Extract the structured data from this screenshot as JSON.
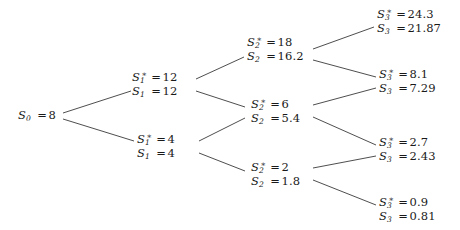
{
  "figure": {
    "type": "binomial-tree",
    "title": "",
    "background_color": "#ffffff",
    "text_color": "#1a1a1a",
    "edge_color": "#3a3a3a"
  },
  "nodes": {
    "s0": {
      "id": "s0",
      "step": 0,
      "lines": [
        {
          "symbol": "S",
          "sub": "0",
          "star": false,
          "eq": "=",
          "value": "8"
        }
      ]
    },
    "s1_up": {
      "id": "s1-up",
      "step": 1,
      "lines": [
        {
          "symbol": "S",
          "sub": "1",
          "star": true,
          "eq": "=",
          "value": "12"
        },
        {
          "symbol": "S",
          "sub": "1",
          "star": false,
          "eq": "=",
          "value": "12"
        }
      ]
    },
    "s1_down": {
      "id": "s1-down",
      "step": 1,
      "lines": [
        {
          "symbol": "S",
          "sub": "1",
          "star": true,
          "eq": "=",
          "value": "4"
        },
        {
          "symbol": "S",
          "sub": "1",
          "star": false,
          "eq": "=",
          "value": "4"
        }
      ]
    },
    "s2_uu": {
      "id": "s2-uu",
      "step": 2,
      "lines": [
        {
          "symbol": "S",
          "sub": "2",
          "star": true,
          "eq": "=",
          "value": "18"
        },
        {
          "symbol": "S",
          "sub": "2",
          "star": false,
          "eq": "=",
          "value": "16.2"
        }
      ]
    },
    "s2_ud": {
      "id": "s2-ud",
      "step": 2,
      "lines": [
        {
          "symbol": "S",
          "sub": "2",
          "star": true,
          "eq": "=",
          "value": "6"
        },
        {
          "symbol": "S",
          "sub": "2",
          "star": false,
          "eq": "=",
          "value": "5.4"
        }
      ]
    },
    "s2_dd": {
      "id": "s2-dd",
      "step": 2,
      "lines": [
        {
          "symbol": "S",
          "sub": "2",
          "star": true,
          "eq": "=",
          "value": "2"
        },
        {
          "symbol": "S",
          "sub": "2",
          "star": false,
          "eq": "=",
          "value": "1.8"
        }
      ]
    },
    "s3_uuu": {
      "id": "s3-uuu",
      "step": 3,
      "lines": [
        {
          "symbol": "S",
          "sub": "3",
          "star": true,
          "eq": "=",
          "value": "24.3"
        },
        {
          "symbol": "S",
          "sub": "3",
          "star": false,
          "eq": "=",
          "value": "21.87"
        }
      ]
    },
    "s3_uud": {
      "id": "s3-uud",
      "step": 3,
      "lines": [
        {
          "symbol": "S",
          "sub": "3",
          "star": true,
          "eq": "=",
          "value": "8.1"
        },
        {
          "symbol": "S",
          "sub": "3",
          "star": false,
          "eq": "=",
          "value": "7.29"
        }
      ]
    },
    "s3_udd": {
      "id": "s3-udd",
      "step": 3,
      "lines": [
        {
          "symbol": "S",
          "sub": "3",
          "star": true,
          "eq": "=",
          "value": "2.7"
        },
        {
          "symbol": "S",
          "sub": "3",
          "star": false,
          "eq": "=",
          "value": "2.43"
        }
      ]
    },
    "s3_ddd": {
      "id": "s3-ddd",
      "step": 3,
      "lines": [
        {
          "symbol": "S",
          "sub": "3",
          "star": true,
          "eq": "=",
          "value": "0.9"
        },
        {
          "symbol": "S",
          "sub": "3",
          "star": false,
          "eq": "=",
          "value": "0.81"
        }
      ]
    }
  },
  "edges": [
    {
      "name": "edge-s0-s1up",
      "from": "s0",
      "to": "s1_up",
      "x1": 63,
      "y1": 113,
      "x2": 131,
      "y2": 91
    },
    {
      "name": "edge-s0-s1down",
      "from": "s0",
      "to": "s1_down",
      "x1": 63,
      "y1": 119,
      "x2": 134,
      "y2": 141
    },
    {
      "name": "edge-s1up-s2uu",
      "from": "s1_up",
      "to": "s2_uu",
      "x1": 196,
      "y1": 79,
      "x2": 244,
      "y2": 57
    },
    {
      "name": "edge-s1up-s2ud",
      "from": "s1_up",
      "to": "s2_ud",
      "x1": 196,
      "y1": 91,
      "x2": 245,
      "y2": 107
    },
    {
      "name": "edge-s1down-s2ud",
      "from": "s1_down",
      "to": "s2_ud",
      "x1": 199,
      "y1": 141,
      "x2": 245,
      "y2": 118
    },
    {
      "name": "edge-s1down-s2dd",
      "from": "s1_down",
      "to": "s2_dd",
      "x1": 199,
      "y1": 153,
      "x2": 245,
      "y2": 171
    },
    {
      "name": "edge-s2uu-s3uuu",
      "from": "s2_uu",
      "to": "s3_uuu",
      "x1": 313,
      "y1": 49,
      "x2": 374,
      "y2": 27
    },
    {
      "name": "edge-s2uu-s3uud",
      "from": "s2_uu",
      "to": "s3_uud",
      "x1": 313,
      "y1": 60,
      "x2": 376,
      "y2": 77
    },
    {
      "name": "edge-s2ud-s3uud",
      "from": "s2_ud",
      "to": "s3_uud",
      "x1": 313,
      "y1": 105,
      "x2": 376,
      "y2": 88
    },
    {
      "name": "edge-s2ud-s3udd",
      "from": "s2_ud",
      "to": "s3_udd",
      "x1": 313,
      "y1": 117,
      "x2": 376,
      "y2": 145
    },
    {
      "name": "edge-s2dd-s3udd",
      "from": "s2_dd",
      "to": "s3_udd",
      "x1": 313,
      "y1": 168,
      "x2": 376,
      "y2": 156
    },
    {
      "name": "edge-s2dd-s3ddd",
      "from": "s2_dd",
      "to": "s3_ddd",
      "x1": 313,
      "y1": 180,
      "x2": 376,
      "y2": 205
    }
  ],
  "layout": {
    "width": 460,
    "height": 230,
    "node_positions": {
      "s0": {
        "x": 18,
        "y": 109,
        "align": "left"
      },
      "s1_up": {
        "x": 132,
        "y": 71,
        "align": "left"
      },
      "s1_down": {
        "x": 137,
        "y": 133,
        "align": "left"
      },
      "s2_uu": {
        "x": 247,
        "y": 36,
        "align": "left"
      },
      "s2_ud": {
        "x": 251,
        "y": 98,
        "align": "left"
      },
      "s2_dd": {
        "x": 251,
        "y": 161,
        "align": "left"
      },
      "s3_uuu": {
        "x": 377,
        "y": 8,
        "align": "left"
      },
      "s3_uud": {
        "x": 379,
        "y": 68,
        "align": "left"
      },
      "s3_udd": {
        "x": 379,
        "y": 136,
        "align": "left"
      },
      "s3_ddd": {
        "x": 379,
        "y": 196,
        "align": "left"
      }
    }
  }
}
